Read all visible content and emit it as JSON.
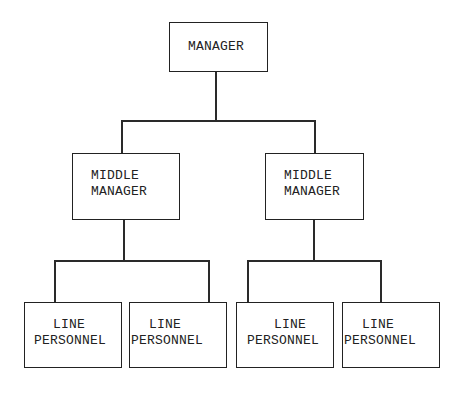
{
  "diagram": {
    "type": "org-chart",
    "root": {
      "label": "MANAGER",
      "children": [
        {
          "label_line1": "MIDDLE",
          "label_line2": "MANAGER",
          "children": [
            {
              "label_line1": "LINE",
              "label_line2": "PERSONNEL"
            },
            {
              "label_line1": "LINE",
              "label_line2": "PERSONNEL"
            }
          ]
        },
        {
          "label_line1": "MIDDLE",
          "label_line2": "MANAGER",
          "children": [
            {
              "label_line1": "LINE",
              "label_line2": "PERSONNEL"
            },
            {
              "label_line1": "LINE",
              "label_line2": "PERSONNEL"
            }
          ]
        }
      ]
    }
  }
}
